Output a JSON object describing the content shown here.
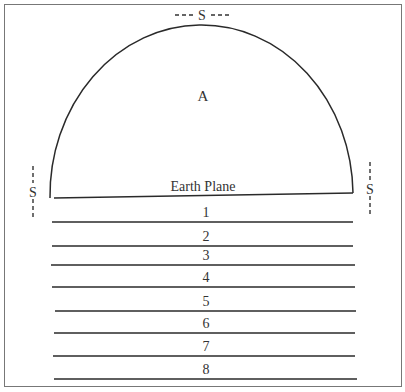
{
  "diagram": {
    "labels": {
      "top_s": "S",
      "left_s": "S",
      "right_s": "S",
      "dome": "A",
      "earth_plane": "Earth Plane"
    },
    "levels": [
      {
        "label": "1",
        "y": 222,
        "x1": 52,
        "x2": 353
      },
      {
        "label": "2",
        "y": 246,
        "x1": 52,
        "x2": 353
      },
      {
        "label": "3",
        "y": 265,
        "x1": 51,
        "x2": 355
      },
      {
        "label": "4",
        "y": 287,
        "x1": 52,
        "x2": 355
      },
      {
        "label": "5",
        "y": 311,
        "x1": 55,
        "x2": 356
      },
      {
        "label": "6",
        "y": 333,
        "x1": 54,
        "x2": 355
      },
      {
        "label": "7",
        "y": 356,
        "x1": 53,
        "x2": 355
      },
      {
        "label": "8",
        "y": 379,
        "x1": 54,
        "x2": 357
      }
    ],
    "colors": {
      "ink": "#2a2a2a",
      "border": "#666666",
      "background": "#ffffff"
    }
  }
}
